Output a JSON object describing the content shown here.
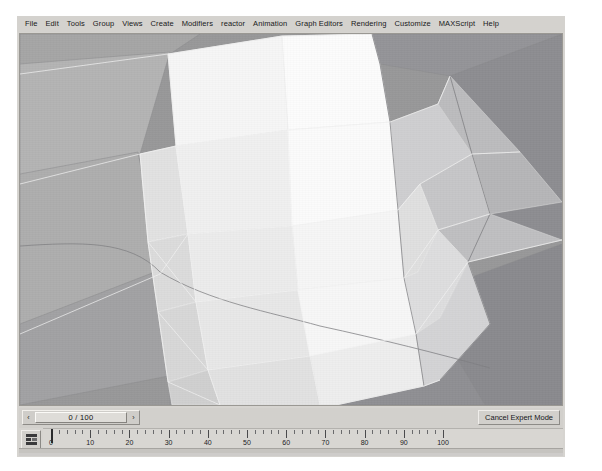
{
  "app": {
    "name": "3ds Max",
    "mode": "Expert Mode"
  },
  "menubar": {
    "items": [
      {
        "label": "File"
      },
      {
        "label": "Edit"
      },
      {
        "label": "Tools"
      },
      {
        "label": "Group"
      },
      {
        "label": "Views"
      },
      {
        "label": "Create"
      },
      {
        "label": "Modifiers"
      },
      {
        "label": "reactor"
      },
      {
        "label": "Animation"
      },
      {
        "label": "Graph Editors"
      },
      {
        "label": "Rendering"
      },
      {
        "label": "Customize"
      },
      {
        "label": "MAXScript"
      },
      {
        "label": "Help"
      }
    ]
  },
  "viewport": {
    "name": "perspective-shaded-viewport",
    "background_color": "#9a9a9a",
    "edge_color": "#e8e8e8",
    "dark_edge_color": "#6e6e70",
    "face_colors": {
      "highlight": "#fbfbfb",
      "light": "#f1f1f1",
      "light_mid": "#e4e4e4",
      "mid": "#d3d3d3",
      "mid_dark": "#c2c2c2",
      "shadow": "#a8a8a8",
      "dark": "#949496",
      "darkest": "#86868a"
    }
  },
  "timeslider": {
    "prev_arrow": "‹",
    "next_arrow": "›",
    "current_frame": 0,
    "end_frame": 100,
    "value_label": "0 / 100"
  },
  "expert_mode_button": {
    "label": "Cancel Expert Mode"
  },
  "trackbar": {
    "anim_icon": "key-filter-icon",
    "major_ticks": [
      0,
      10,
      20,
      30,
      40,
      50,
      60,
      70,
      80,
      90,
      100
    ],
    "tick_labels": [
      "0",
      "10",
      "20",
      "30",
      "40",
      "50",
      "60",
      "70",
      "80",
      "90",
      "100"
    ],
    "minor_ticks_per_major": 5,
    "range_start": 0,
    "range_end": 100
  }
}
